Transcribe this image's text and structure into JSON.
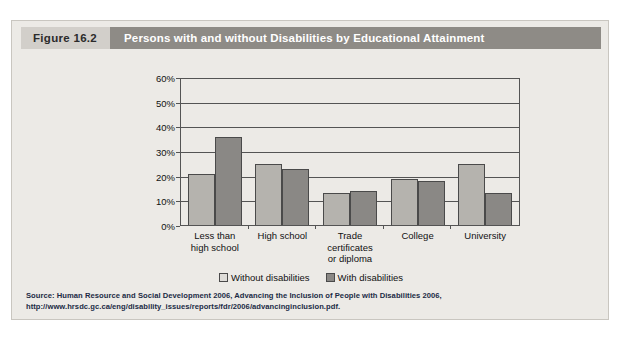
{
  "figure": {
    "number_label": "Figure 16.2",
    "title": "Persons with and without Disabilities by Educational Attainment",
    "source": "Source: Human Resource and Social Development 2006, Advancing the Inclusion of People with Disabilities 2006, http://www.hrsdc.gc.ca/eng/disability_issues/reports/fdr/2006/advancinginclusion.pdf."
  },
  "colors": {
    "panel_background": "#eceae6",
    "header_figno_background": "#d2cfca",
    "header_title_background": "#8e8b86",
    "header_title_text": "#ffffff",
    "bar_without_disabilities": "#b5b3ae",
    "bar_with_disabilities": "#8a8885",
    "axis_line": "#545454",
    "source_text": "#1b2a45"
  },
  "chart_data": {
    "type": "bar",
    "title": "Persons with and without Disabilities by Educational Attainment",
    "xlabel": "",
    "ylabel": "",
    "ylim": [
      0,
      60
    ],
    "grid": true,
    "legend_position": "bottom",
    "ytick_labels": [
      "0%",
      "10%",
      "20%",
      "30%",
      "40%",
      "50%",
      "60%"
    ],
    "ytick_values": [
      0,
      10,
      20,
      30,
      40,
      50,
      60
    ],
    "categories": [
      "Less than high school",
      "High school",
      "Trade certificates or diploma",
      "College",
      "University"
    ],
    "category_lines": [
      [
        "Less than",
        "high school"
      ],
      [
        "High school"
      ],
      [
        "Trade",
        "certificates",
        "or diploma"
      ],
      [
        "College"
      ],
      [
        "University"
      ]
    ],
    "series": [
      {
        "name": "Without disabilities",
        "color": "#b5b3ae",
        "values": [
          21,
          25,
          13,
          19,
          25
        ]
      },
      {
        "name": "With disabilities",
        "color": "#8a8885",
        "values": [
          36,
          23,
          14,
          18,
          13
        ]
      }
    ]
  }
}
